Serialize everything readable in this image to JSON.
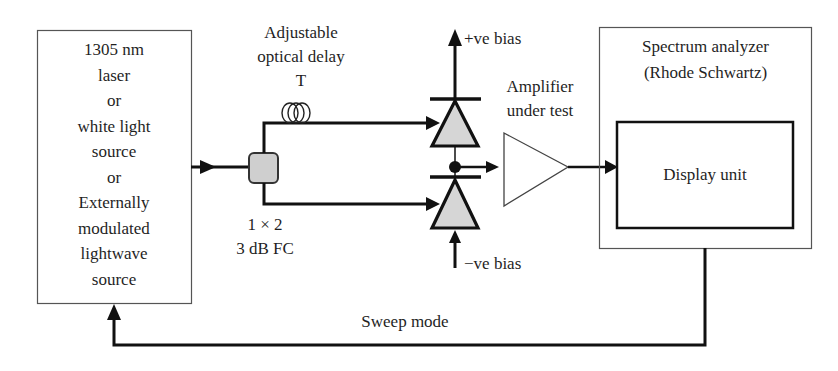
{
  "diagram": {
    "type": "block-diagram",
    "source_block": {
      "lines": [
        "1305 nm",
        "laser",
        "or",
        "white light",
        "source",
        "or",
        "Externally",
        "modulated",
        "lightwave",
        "source"
      ]
    },
    "delay": {
      "lines": [
        "Adjustable",
        "optical delay",
        "T"
      ]
    },
    "coupler": {
      "lines": [
        "1 × 2",
        "3 dB FC"
      ]
    },
    "bias": {
      "positive": "+ve bias",
      "negative": "−ve bias"
    },
    "amplifier": {
      "lines": [
        "Amplifier",
        "under test"
      ]
    },
    "analyzer": {
      "lines": [
        "Spectrum analyzer",
        "(Rhode Schwartz)"
      ],
      "display_label": "Display unit"
    },
    "feedback": {
      "label": "Sweep mode"
    },
    "colors": {
      "line": "#111111",
      "thin_border": "#555555",
      "fill_gray": "#cfcfcf",
      "background": "#ffffff"
    }
  }
}
